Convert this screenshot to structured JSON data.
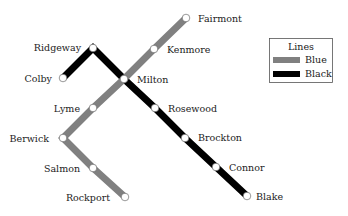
{
  "legend": {
    "title": "Lines",
    "items": [
      {
        "label": "Blue",
        "color": "#808080"
      },
      {
        "label": "Black",
        "color": "#000000"
      }
    ]
  },
  "lines": {
    "blue": {
      "name": "Blue",
      "color": "#808080",
      "stations": [
        "Fairmont",
        "Kenmore",
        "Milton",
        "Lyme",
        "Berwick",
        "Salmon",
        "Rockport"
      ]
    },
    "black": {
      "name": "Black",
      "color": "#000000",
      "stations": [
        "Colby",
        "Ridgeway",
        "Milton",
        "Rosewood",
        "Brockton",
        "Connor",
        "Blake"
      ]
    }
  },
  "stations": {
    "fairmont": "Fairmont",
    "kenmore": "Kenmore",
    "ridgeway": "Ridgeway",
    "colby": "Colby",
    "milton": "Milton",
    "lyme": "Lyme",
    "rosewood": "Rosewood",
    "berwick": "Berwick",
    "brockton": "Brockton",
    "salmon": "Salmon",
    "connor": "Connor",
    "rockport": "Rockport",
    "blake": "Blake"
  }
}
